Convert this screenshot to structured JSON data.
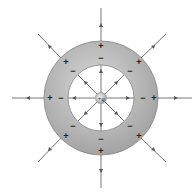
{
  "diagram": {
    "center_charge_label": "+q",
    "outer_surface_sign": "+",
    "inner_surface_sign": "−",
    "colors": {
      "shell_fill": "#a8a8a8",
      "shell_highlight": "#d6d6d6",
      "line": "#666666",
      "sign": "#222222",
      "background": "#ffffff"
    },
    "geometry": {
      "cx": 101,
      "cy": 98,
      "outer_r": 57,
      "inner_r": 33,
      "charge_r": 5,
      "field_line_directions_deg": [
        0,
        45,
        90,
        135,
        180,
        225,
        270,
        315
      ]
    },
    "outer_signs_count": 8,
    "inner_signs_count": 8
  }
}
